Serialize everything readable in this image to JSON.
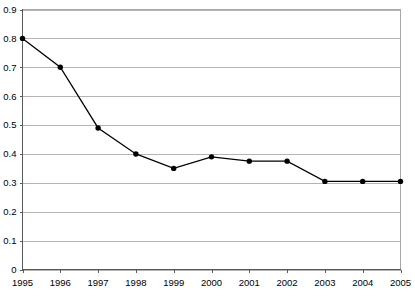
{
  "chart_data": {
    "type": "line",
    "title": "",
    "subtitle": "",
    "xlabel": "",
    "ylabel": "",
    "categories": [
      "1995",
      "1996",
      "1997",
      "1998",
      "1999",
      "2000",
      "2001",
      "2002",
      "2003",
      "2004",
      "2005"
    ],
    "x": [
      1995,
      1996,
      1997,
      1998,
      1999,
      2000,
      2001,
      2002,
      2003,
      2004,
      2005
    ],
    "values": [
      0.8,
      0.7,
      0.49,
      0.4,
      0.35,
      0.39,
      0.375,
      0.375,
      0.305,
      0.305,
      0.305
    ],
    "series": [
      {
        "name": "series-1",
        "values": [
          0.8,
          0.7,
          0.49,
          0.4,
          0.35,
          0.39,
          0.375,
          0.375,
          0.305,
          0.305,
          0.305
        ],
        "line_color": "#000000",
        "marker": "circle",
        "marker_color": "#000000"
      }
    ],
    "ylim": [
      0,
      0.9
    ],
    "ytick_labels": [
      "0",
      "0.1",
      "0.2",
      "0.3",
      "0.4",
      "0.5",
      "0.6",
      "0.7",
      "0.8",
      "0.9"
    ],
    "ytick_values": [
      0,
      0.1,
      0.2,
      0.3,
      0.4,
      0.5,
      0.6,
      0.7,
      0.8,
      0.9
    ],
    "xtick_labels": [
      "1995",
      "1996",
      "1997",
      "1998",
      "1999",
      "2000",
      "2001",
      "2002",
      "2003",
      "2004",
      "2005"
    ],
    "grid": "horizontal",
    "grid_color": "#b4b4b4",
    "legend": "none",
    "legend_position": "none",
    "annotations": [],
    "axis_color": "#5a5a5a",
    "background_color": "#ffffff"
  }
}
